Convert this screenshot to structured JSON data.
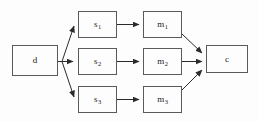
{
  "diagram": {
    "type": "flow-graph",
    "background_color": "#fdfdfd",
    "line_color": "#333333",
    "box_border_color": "#5a5a5a",
    "text_color": "#1a1a1a",
    "nodes": [
      {
        "id": "d",
        "base": "d",
        "sub": "",
        "x": 12,
        "y": 45,
        "w": 46,
        "h": 31
      },
      {
        "id": "s1",
        "base": "s",
        "sub": "1",
        "x": 78,
        "y": 11,
        "w": 39,
        "h": 27
      },
      {
        "id": "s2",
        "base": "s",
        "sub": "2",
        "x": 78,
        "y": 48,
        "w": 39,
        "h": 27
      },
      {
        "id": "s3",
        "base": "s",
        "sub": "3",
        "x": 78,
        "y": 86,
        "w": 39,
        "h": 27
      },
      {
        "id": "m1",
        "base": "m",
        "sub": "1",
        "x": 143,
        "y": 11,
        "w": 39,
        "h": 27
      },
      {
        "id": "m2",
        "base": "m",
        "sub": "2",
        "x": 143,
        "y": 48,
        "w": 39,
        "h": 27
      },
      {
        "id": "m3",
        "base": "m",
        "sub": "3",
        "x": 143,
        "y": 86,
        "w": 39,
        "h": 27
      },
      {
        "id": "c",
        "base": "c",
        "sub": "",
        "x": 206,
        "y": 45,
        "w": 42,
        "h": 28
      }
    ],
    "edges": [
      {
        "from": "d",
        "to": "s1",
        "kind": "diagonal-up"
      },
      {
        "from": "d",
        "to": "s2",
        "kind": "horizontal"
      },
      {
        "from": "d",
        "to": "s3",
        "kind": "diagonal-down"
      },
      {
        "from": "s1",
        "to": "m1",
        "kind": "horizontal"
      },
      {
        "from": "s2",
        "to": "m2",
        "kind": "horizontal"
      },
      {
        "from": "s3",
        "to": "m3",
        "kind": "horizontal"
      },
      {
        "from": "m1",
        "to": "c",
        "kind": "diagonal-down"
      },
      {
        "from": "m2",
        "to": "c",
        "kind": "horizontal"
      },
      {
        "from": "m3",
        "to": "c",
        "kind": "diagonal-up"
      }
    ]
  }
}
